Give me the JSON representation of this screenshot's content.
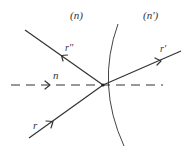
{
  "diagram": {
    "media": {
      "left": "(n)",
      "right": "(n')"
    },
    "rays": {
      "incident": {
        "label": "r",
        "direction": "toward interface"
      },
      "reflected": {
        "label": "r''",
        "direction": "away from interface, up-left"
      },
      "refracted": {
        "label": "r'",
        "direction": "away from interface, up-right"
      }
    },
    "normal": {
      "label": "n",
      "style": "dashed"
    },
    "surface": {
      "type": "curved interface (arc)"
    },
    "colors": {
      "line": "#333333",
      "background": "#ffffff"
    }
  }
}
